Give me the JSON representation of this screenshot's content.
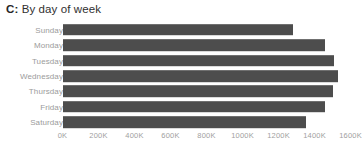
{
  "chart_data": {
    "type": "bar",
    "orientation": "horizontal",
    "title": "C: By day of week",
    "title_key": "C:",
    "title_text": " By day of week",
    "categories": [
      "Sunday",
      "Monday",
      "Tuesday",
      "Wednesday",
      "Thursday",
      "Friday",
      "Saturday"
    ],
    "values": [
      1278000,
      1461000,
      1511000,
      1533000,
      1500000,
      1456000,
      1350000
    ],
    "xlabel": "",
    "ylabel": "",
    "xlim": [
      0,
      1600000
    ],
    "xticks": [
      0,
      200000,
      400000,
      600000,
      800000,
      1000000,
      1200000,
      1400000,
      1600000
    ],
    "xtick_labels": [
      "0K",
      "200K",
      "400K",
      "600K",
      "800K",
      "1000K",
      "1200K",
      "1400K",
      "1600K"
    ],
    "grid": false,
    "legend": null,
    "bar_color": "#4d4d4d",
    "background_color": "#ffffff",
    "label_color": "#9b9b9b",
    "tick_color": "#a0a0a0",
    "title_color": "#303030"
  }
}
